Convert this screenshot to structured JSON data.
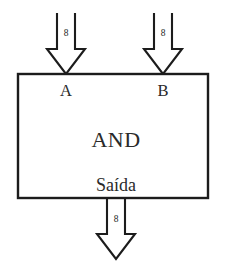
{
  "diagram": {
    "type": "logic-block-diagram",
    "title": "AND",
    "background_color": "#ffffff",
    "line_color": "#1c1c1c",
    "text_color": "#2a2a2a",
    "gate": {
      "label": "AND",
      "output_label": "Saída",
      "box": {
        "x": 18,
        "y": 74,
        "width": 190,
        "height": 124
      }
    },
    "inputs": [
      {
        "name": "input-a",
        "label": "A",
        "bus_width": "8",
        "direction": "down",
        "arrow": {
          "cx": 66,
          "top": 13,
          "tip": 74,
          "shaft_half_width": 9,
          "head_half_width": 19,
          "head_height": 25
        },
        "label_pos": {
          "x": 66,
          "y": 96
        },
        "width_label_pos": {
          "x": 66,
          "y": 36
        }
      },
      {
        "name": "input-b",
        "label": "B",
        "bus_width": "8",
        "direction": "down",
        "arrow": {
          "cx": 163,
          "top": 13,
          "tip": 74,
          "shaft_half_width": 9,
          "head_half_width": 19,
          "head_height": 25
        },
        "label_pos": {
          "x": 163,
          "y": 96
        },
        "width_label_pos": {
          "x": 163,
          "y": 36
        }
      }
    ],
    "outputs": [
      {
        "name": "output-saida",
        "label": "Saída",
        "bus_width": "8",
        "direction": "down",
        "arrow": {
          "cx": 116,
          "top": 198,
          "tip": 259,
          "shaft_half_width": 9,
          "head_half_width": 19,
          "head_height": 25
        },
        "label_pos": {
          "x": 116,
          "y": 191
        },
        "width_label_pos": {
          "x": 116,
          "y": 222
        }
      }
    ],
    "gate_label_pos": {
      "x": 116,
      "y": 147
    }
  }
}
